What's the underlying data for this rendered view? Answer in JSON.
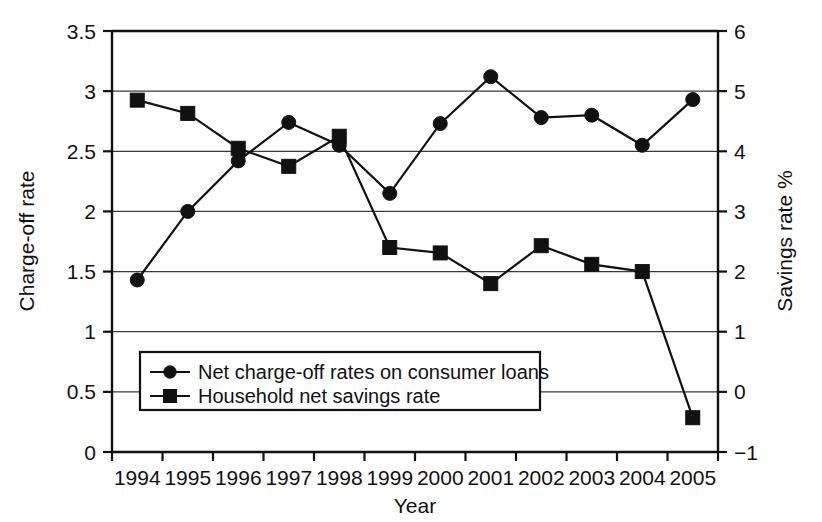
{
  "chart_data": {
    "type": "line",
    "title": "",
    "subtitle": "",
    "xlabel": "Year",
    "ylabel": "Charge-off rate",
    "y2label": "Savings rate %",
    "categories": [
      "1994",
      "1995",
      "1996",
      "1997",
      "1998",
      "1999",
      "2000",
      "2001",
      "2002",
      "2003",
      "2004",
      "2005"
    ],
    "x": [
      1994,
      1995,
      1996,
      1997,
      1998,
      1999,
      2000,
      2001,
      2002,
      2003,
      2004,
      2005
    ],
    "ylim": [
      0,
      3.5
    ],
    "y2lim": [
      -1,
      6
    ],
    "yticks": [
      "0",
      "0.5",
      "1",
      "1.5",
      "2",
      "2.5",
      "3",
      "3.5"
    ],
    "ytick_values": [
      0,
      0.5,
      1,
      1.5,
      2,
      2.5,
      3,
      3.5
    ],
    "y2ticks": [
      "−1",
      "0",
      "1",
      "2",
      "3",
      "4",
      "5",
      "6"
    ],
    "y2tick_values": [
      -1,
      0,
      1,
      2,
      3,
      4,
      5,
      6
    ],
    "grid": true,
    "grid_axis": "y",
    "legend_position": "lower-left-inside",
    "series": [
      {
        "name": "Net charge-off rates on consumer loans",
        "axis": "left",
        "marker": "circle",
        "color": "#111111",
        "values": [
          1.43,
          2.0,
          2.42,
          2.74,
          2.55,
          2.15,
          2.73,
          3.12,
          2.78,
          2.8,
          2.55,
          2.93
        ]
      },
      {
        "name": "Household net savings rate",
        "axis": "right",
        "marker": "square",
        "color": "#111111",
        "values": [
          4.85,
          4.63,
          4.05,
          3.75,
          4.25,
          2.4,
          2.31,
          1.8,
          2.43,
          2.12,
          2.0,
          -0.43
        ]
      }
    ],
    "annotations": []
  },
  "legend": {
    "entries": [
      {
        "label": "Net charge-off rates on consumer loans",
        "marker": "circle"
      },
      {
        "label": "Household net savings rate",
        "marker": "square"
      }
    ]
  },
  "colors": {
    "ink": "#111111",
    "grid": "#3a3a3a",
    "background": "#ffffff"
  }
}
